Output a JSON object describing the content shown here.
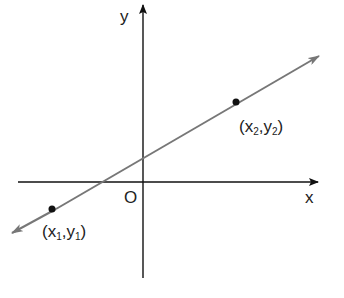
{
  "diagram": {
    "title": "",
    "axes": {
      "x_label": "x",
      "y_label": "y",
      "origin_label": "O",
      "color": "#111111"
    },
    "line": {
      "color": "#777777",
      "description": "straight line with arrows at both ends passing through two points"
    },
    "points": [
      {
        "name": "P1",
        "x_sym": "x",
        "x_sub": "1",
        "y_sym": "y",
        "y_sub": "1",
        "open": "(",
        "sep": ",",
        "close": ")"
      },
      {
        "name": "P2",
        "x_sym": "x",
        "x_sub": "2",
        "y_sym": "y",
        "y_sub": "2",
        "open": "(",
        "sep": ",",
        "close": ")"
      }
    ]
  }
}
